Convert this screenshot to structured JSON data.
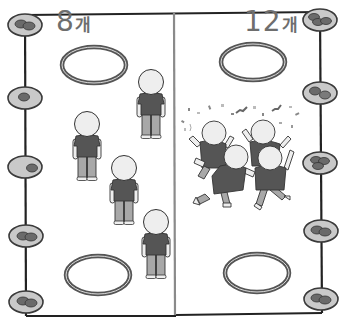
{
  "scene": {
    "description": "Grayscale illustration of a stone-collecting game field split in two halves",
    "colors": {
      "background": "#ffffff",
      "border": "#222222",
      "divider": "#8a8a8a",
      "disc_fill": "#c9c9c9",
      "disc_stroke": "#3a3a3a",
      "stone": "#6a6a6a",
      "ring": "#555555",
      "shirt": "#555555",
      "pants": "#a8a8a8",
      "head": "#eeeeee",
      "label": "#6e6e6e"
    }
  },
  "left_team": {
    "count_number": "8",
    "count_unit": "개",
    "label": "8개",
    "state": "standing",
    "players": 5
  },
  "right_team": {
    "count_number": "12",
    "count_unit": "개",
    "label": "12개",
    "state": "celebrating",
    "players": 4
  },
  "left_discs": [
    {
      "cx": 25,
      "cy": 25,
      "stones": 2
    },
    {
      "cx": 25,
      "cy": 98,
      "stones": 1
    },
    {
      "cx": 25,
      "cy": 167,
      "stones": 1
    },
    {
      "cx": 26,
      "cy": 236,
      "stones": 2
    },
    {
      "cx": 26,
      "cy": 302,
      "stones": 2
    }
  ],
  "right_discs": [
    {
      "cx": 320,
      "cy": 20,
      "stones": 3
    },
    {
      "cx": 320,
      "cy": 93,
      "stones": 2
    },
    {
      "cx": 320,
      "cy": 163,
      "stones": 3
    },
    {
      "cx": 321,
      "cy": 231,
      "stones": 2
    },
    {
      "cx": 321,
      "cy": 299,
      "stones": 2
    }
  ]
}
